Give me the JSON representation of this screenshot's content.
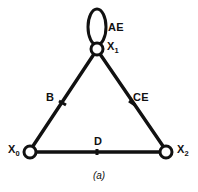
{
  "figure": {
    "caption": "(a)",
    "background_color": "#ffffff",
    "stroke_color": "#111111",
    "node_fill_color": "#ffffff"
  },
  "nodes": [
    {
      "id": "n1",
      "label": "X",
      "subscript": "1",
      "x": 97,
      "y": 49,
      "radius": 6
    },
    {
      "id": "n0",
      "label": "X",
      "subscript": "0",
      "x": 30,
      "y": 152,
      "radius": 6
    },
    {
      "id": "n2",
      "label": "X",
      "subscript": "2",
      "x": 166,
      "y": 152,
      "radius": 6
    }
  ],
  "edges": [
    {
      "id": "e-loop",
      "label": "AE",
      "from": "n1",
      "to": "n1",
      "type": "self-loop"
    },
    {
      "id": "e-left",
      "label": "B",
      "from": "n1",
      "to": "n0",
      "type": "line"
    },
    {
      "id": "e-right",
      "label": "CE",
      "from": "n1",
      "to": "n2",
      "type": "line"
    },
    {
      "id": "e-base",
      "label": "D",
      "from": "n0",
      "to": "n2",
      "type": "line"
    }
  ],
  "labels": {
    "ae": "AE",
    "b": "B",
    "ce": "CE",
    "d": "D",
    "x1_base": "X",
    "x1_sub": "1",
    "x0_base": "X",
    "x0_sub": "0",
    "x2_base": "X",
    "x2_sub": "2"
  }
}
